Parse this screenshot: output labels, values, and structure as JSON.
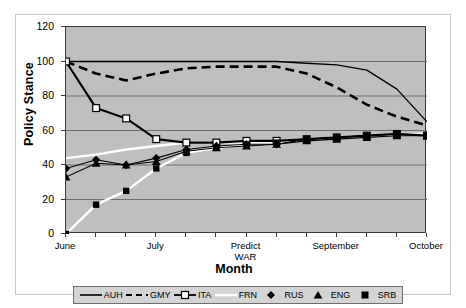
{
  "chart_data": {
    "type": "line",
    "title": "",
    "xlabel": "Month",
    "ylabel": "Policy Stance",
    "ylim": [
      0,
      120
    ],
    "ytick_values": [
      0,
      20,
      40,
      60,
      80,
      100,
      120
    ],
    "ytick_labels": [
      "0",
      "20",
      "40",
      "60",
      "80",
      "100",
      "120"
    ],
    "grid": true,
    "grid_axis": "y",
    "plot_background": "#BFBFBF",
    "legend_position": "bottom",
    "x_tick_count": 13,
    "xtick_labels": [
      "June",
      "July",
      "Predict WAR",
      "September",
      "October"
    ],
    "xtick_label_positions": [
      0,
      3,
      6,
      9,
      12
    ],
    "x": [
      0,
      1,
      2,
      3,
      4,
      5,
      6,
      7,
      8,
      9,
      10,
      11,
      12
    ],
    "series": [
      {
        "name": "AUH",
        "style": "solid-black-line",
        "color": "#000000",
        "values": [
          100,
          100,
          100,
          100,
          100,
          100,
          100,
          100,
          99,
          98,
          95,
          84,
          65
        ]
      },
      {
        "name": "GMY",
        "style": "dashed-black-line",
        "color": "#000000",
        "values": [
          100,
          93,
          89,
          93,
          96,
          97,
          97,
          97,
          93,
          85,
          75,
          68,
          63
        ]
      },
      {
        "name": "ITA",
        "style": "black-line-white-square-markers",
        "color": "#000000",
        "marker": "square-open",
        "values": [
          100,
          73,
          67,
          55,
          53,
          53,
          54,
          54,
          55,
          56,
          57,
          58,
          57
        ]
      },
      {
        "name": "FRN",
        "style": "white-line",
        "color": "#FFFFFF",
        "values": [
          44,
          46,
          49,
          51,
          53,
          53,
          53,
          54,
          55,
          56,
          57,
          58,
          58
        ]
      },
      {
        "name": "RUS",
        "style": "black-line-diamond-markers",
        "color": "#000000",
        "marker": "diamond",
        "values": [
          38,
          43,
          40,
          44,
          49,
          51,
          52,
          52,
          55,
          56,
          57,
          58,
          57
        ]
      },
      {
        "name": "ENG",
        "style": "black-line-triangle-markers",
        "color": "#000000",
        "marker": "triangle",
        "values": [
          33,
          41,
          40,
          42,
          48,
          50,
          51,
          52,
          54,
          55,
          56,
          57,
          57
        ]
      },
      {
        "name": "SRB",
        "style": "white-line-square-markers",
        "color": "#000000",
        "marker": "square-filled",
        "values": [
          0,
          17,
          25,
          38,
          47,
          50,
          52,
          53,
          55,
          56,
          57,
          58,
          57
        ]
      }
    ]
  },
  "axes": {
    "y_title": "Policy Stance",
    "x_title": "Month",
    "y_labels": [
      "120",
      "100",
      "80",
      "60",
      "40",
      "20",
      "0"
    ],
    "x_labels": [
      {
        "line1": "June",
        "line2": ""
      },
      {
        "line1": "July",
        "line2": ""
      },
      {
        "line1": "Predict",
        "line2": "WAR"
      },
      {
        "line1": "September",
        "line2": ""
      },
      {
        "line1": "October",
        "line2": ""
      }
    ]
  },
  "legend": {
    "items": [
      {
        "label": "AUH",
        "key": "solid-line"
      },
      {
        "label": "GMY",
        "key": "dashed-line"
      },
      {
        "label": "ITA",
        "key": "line-open-square"
      },
      {
        "label": "FRN",
        "key": "white-line"
      },
      {
        "label": "RUS",
        "key": "diamond-marker"
      },
      {
        "label": "ENG",
        "key": "triangle-marker"
      },
      {
        "label": "SRB",
        "key": "filled-square-marker"
      }
    ]
  },
  "colors": {
    "plot_bg": "#BFBFBF",
    "axis": "#3A3A3A",
    "gridline": "#6E6E6E",
    "series_dark": "#000000",
    "series_light": "#FFFFFF",
    "legend_bg": "#D4D4D4"
  }
}
